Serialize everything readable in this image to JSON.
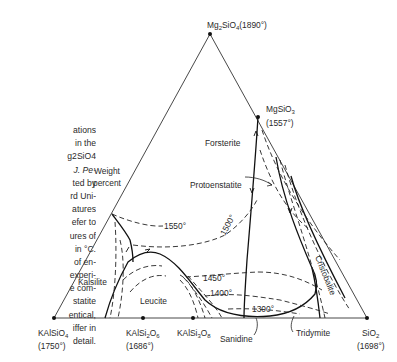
{
  "caption_lines": [
    "ations",
    "in the",
    "g2SiO4",
    "J. Pe-",
    "ted by",
    "rd Uni-",
    "atures",
    "efer to",
    "ures of",
    "in °C.",
    "of en-",
    "experi-",
    "e com-",
    "statite",
    "entical,",
    "iffer in",
    "detail."
  ],
  "vertices": {
    "top": {
      "formula": "Mg2SiO4",
      "temp": "(1890°)"
    },
    "left": {
      "formula": "KAlSiO4",
      "temp": "(1750°)"
    },
    "right": {
      "formula": "SiO2",
      "temp": "(1698°)"
    }
  },
  "compounds": {
    "mgsio3": {
      "formula": "MgSiO3",
      "temp": "(1557°)"
    },
    "kalsi2o6": {
      "formula": "KAlSi2O6",
      "temp": "(1686°)"
    },
    "kalsi3o8": {
      "formula": "KAlSi3O8"
    }
  },
  "phase_fields": {
    "forsterite": "Forsterite",
    "protoenstatite": "Protoenstatite",
    "kalsilite": "Kalsilite",
    "leucite": "Leucite",
    "sanidine": "Sanidine",
    "tridymite": "Tridymite",
    "cristobalite": "Cristobalite"
  },
  "isotherms": {
    "t1550": "1550°",
    "t1500": "1500°",
    "t1450": "1450°",
    "t1400": "1400°",
    "t1300": "1300°"
  },
  "axis_note": {
    "line1": "Weight",
    "line2": "percent"
  }
}
